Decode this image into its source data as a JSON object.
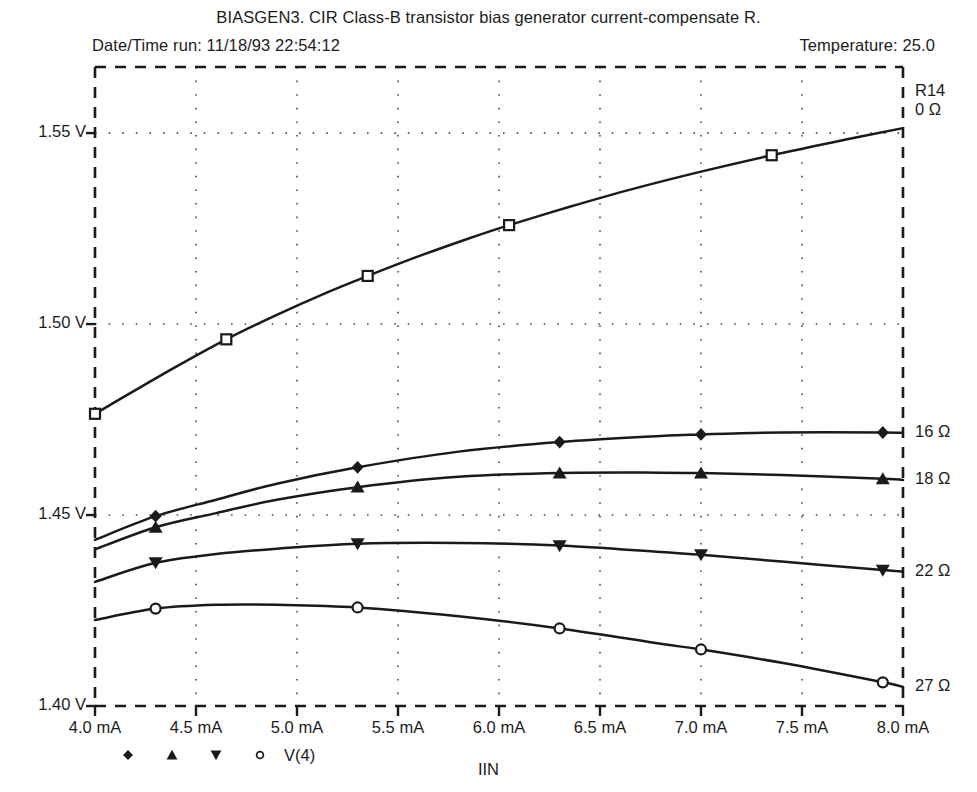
{
  "header": {
    "main_title": "BIASGEN3. CIR Class-B transistor bias generator current-compensate R.",
    "date_time": "Date/Time run: 11/18/93  22:54:12",
    "temperature": "Temperature: 25.0"
  },
  "chart_data": {
    "type": "line",
    "title": "BIASGEN3. CIR Class-B transistor bias generator current-compensate R.",
    "xlabel": "IIN",
    "ylabel": "",
    "xlim": [
      4.0,
      8.0
    ],
    "ylim": [
      1.4,
      1.5673
    ],
    "grid": true,
    "xticks": [
      4.0,
      4.5,
      5.0,
      5.5,
      6.0,
      6.5,
      7.0,
      7.5,
      8.0
    ],
    "xticklabels": [
      "4.0 mA",
      "4.5 mA",
      "5.0 mA",
      "5.5 mA",
      "6.0 mA",
      "6.5 mA",
      "7.0 mA",
      "7.5 mA",
      "8.0 mA"
    ],
    "yticks": [
      1.4,
      1.45,
      1.5,
      1.55
    ],
    "yticklabels": [
      "1.40 V",
      "1.45 V",
      "1.50 V",
      "1.55 V"
    ],
    "legend_position": "bottom-left",
    "legend_series_label": "V(4)",
    "parameter_name": "R14",
    "series": [
      {
        "name": "0 Ω",
        "param_label": "0 Ω",
        "marker": "open-square",
        "end_value_label": "0 Ω",
        "x": [
          4.0,
          4.2,
          4.4,
          4.65,
          4.9,
          5.15,
          5.35,
          5.6,
          5.85,
          6.05,
          6.35,
          6.65,
          7.0,
          7.35,
          7.7,
          8.0
        ],
        "y": [
          1.4765,
          1.4827,
          1.4888,
          1.496,
          1.5024,
          1.5083,
          1.5126,
          1.5177,
          1.5224,
          1.5259,
          1.5307,
          1.5352,
          1.5399,
          1.5442,
          1.5481,
          1.5513
        ]
      },
      {
        "name": "16 Ω",
        "param_label": "16 Ω",
        "marker": "filled-diamond",
        "end_value_label": "16 Ω",
        "x": [
          4.0,
          4.3,
          4.6,
          4.9,
          5.3,
          5.8,
          6.3,
          6.8,
          7.0,
          7.4,
          7.9,
          8.0
        ],
        "y": [
          1.4435,
          1.4497,
          1.454,
          1.4582,
          1.4625,
          1.4666,
          1.4691,
          1.4707,
          1.4711,
          1.4716,
          1.4716,
          1.4715
        ]
      },
      {
        "name": "18 Ω",
        "param_label": "18 Ω",
        "marker": "filled-triangle-up",
        "end_value_label": "18 Ω",
        "x": [
          4.0,
          4.3,
          4.6,
          4.9,
          5.3,
          5.8,
          6.3,
          6.8,
          7.0,
          7.4,
          7.9,
          8.0
        ],
        "y": [
          1.441,
          1.4468,
          1.4505,
          1.454,
          1.4573,
          1.46,
          1.461,
          1.4611,
          1.461,
          1.4605,
          1.4595,
          1.4592
        ]
      },
      {
        "name": "22 Ω",
        "param_label": "22 Ω",
        "marker": "filled-triangle-down",
        "end_value_label": "22 Ω",
        "x": [
          4.0,
          4.3,
          4.6,
          4.9,
          5.3,
          5.8,
          6.3,
          6.8,
          7.0,
          7.4,
          7.9,
          8.0
        ],
        "y": [
          1.4325,
          1.4375,
          1.4398,
          1.4412,
          1.4425,
          1.4427,
          1.442,
          1.4403,
          1.4396,
          1.4378,
          1.4356,
          1.4352
        ]
      },
      {
        "name": "27 Ω",
        "param_label": "27 Ω",
        "marker": "open-circle",
        "end_value_label": "27 Ω",
        "x": [
          4.0,
          4.3,
          4.6,
          4.9,
          5.3,
          5.8,
          6.3,
          6.8,
          7.0,
          7.4,
          7.9,
          8.0
        ],
        "y": [
          1.4225,
          1.4255,
          1.4265,
          1.4265,
          1.4258,
          1.4235,
          1.4203,
          1.4163,
          1.4148,
          1.4113,
          1.4062,
          1.405
        ]
      }
    ]
  },
  "axes": {
    "y_labels": [
      "1.55 V",
      "1.50 V",
      "1.45 V",
      "1.40 V"
    ],
    "x_labels": [
      "4.0 mA",
      "4.5 mA",
      "5.0 mA",
      "5.5 mA",
      "6.0 mA",
      "6.5 mA",
      "7.0 mA",
      "7.5 mA",
      "8.0 mA"
    ],
    "x_title": "IIN"
  },
  "right_labels": {
    "param_header": "R14",
    "items": [
      "0 Ω",
      "16 Ω",
      "18 Ω",
      "22 Ω",
      "27 Ω"
    ]
  },
  "legend": {
    "markers": [
      "filled-diamond",
      "filled-triangle-up",
      "filled-triangle-down",
      "open-circle"
    ],
    "label": "V(4)"
  },
  "style": {
    "line_color": "#1a1a1a",
    "grid_color": "#4a4a4a",
    "background": "#ffffff"
  }
}
